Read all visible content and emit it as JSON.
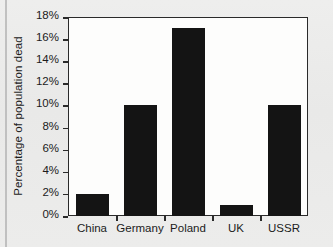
{
  "chart_data": {
    "type": "bar",
    "title": "",
    "xlabel": "",
    "ylabel": "Percentage of population dead",
    "categories": [
      "China",
      "Germany",
      "Poland",
      "UK",
      "USSR"
    ],
    "values": [
      2,
      10,
      17,
      1,
      10
    ],
    "ylim": [
      0,
      18
    ],
    "ytick_labels": [
      "0%",
      "2%",
      "4%",
      "6%",
      "8%",
      "10%",
      "12%",
      "14%",
      "16%",
      "18%"
    ],
    "ytick_values": [
      0,
      2,
      4,
      6,
      8,
      10,
      12,
      14,
      16,
      18
    ],
    "grid": false,
    "legend": null,
    "bar_color": "#141414",
    "plot_background": "#fdfdfc",
    "axis_color": "#2a2a2a",
    "page_background": "#ececeb"
  }
}
